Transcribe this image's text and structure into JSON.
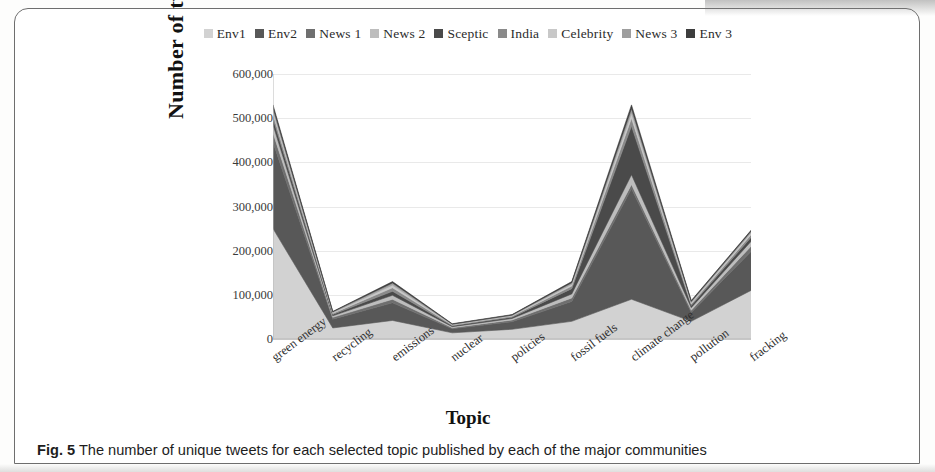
{
  "figure": {
    "caption_prefix": "Fig. 5",
    "caption_text": "The number of unique tweets for each selected topic published by each of the major communities"
  },
  "chart_data": {
    "type": "area",
    "stacked": true,
    "title": "",
    "xlabel": "Topic",
    "ylabel": "Number of tweets",
    "ylim": [
      0,
      600000
    ],
    "yticks": [
      0,
      100000,
      200000,
      300000,
      400000,
      500000,
      600000
    ],
    "ytick_labels": [
      "0",
      "100,000",
      "200,000",
      "300,000",
      "400,000",
      "500,000",
      "600,000"
    ],
    "grid": true,
    "legend_position": "top",
    "categories": [
      "green energy",
      "recycling",
      "emissions",
      "nuclear",
      "policies",
      "fossil fuels",
      "climate change",
      "pollution",
      "fracking"
    ],
    "series": [
      {
        "name": "Env1",
        "color": "#d2d2d2",
        "values": [
          250000,
          25000,
          42000,
          14000,
          22000,
          40000,
          90000,
          40000,
          110000
        ]
      },
      {
        "name": "Env2",
        "color": "#585858",
        "values": [
          195000,
          20000,
          40000,
          9000,
          17000,
          45000,
          250000,
          20000,
          88000
        ]
      },
      {
        "name": "News 1",
        "color": "#6f6f6f",
        "values": [
          22000,
          4000,
          8000,
          2500,
          4000,
          8000,
          10000,
          5000,
          12000
        ]
      },
      {
        "name": "News 2",
        "color": "#bdbdbd",
        "values": [
          18000,
          3500,
          9000,
          2500,
          3500,
          9000,
          22000,
          6000,
          11000
        ]
      },
      {
        "name": "Sceptic",
        "color": "#4a4a4a",
        "values": [
          14000,
          3000,
          9000,
          2000,
          3000,
          12000,
          110000,
          5000,
          9000
        ]
      },
      {
        "name": "India",
        "color": "#8a8a8a",
        "values": [
          10000,
          2500,
          8000,
          1500,
          2000,
          6000,
          18000,
          3500,
          6000
        ]
      },
      {
        "name": "Celebrity",
        "color": "#c8c8c8",
        "values": [
          8000,
          2000,
          6000,
          1200,
          1500,
          4000,
          12000,
          3000,
          4500
        ]
      },
      {
        "name": "News 3",
        "color": "#9e9e9e",
        "values": [
          7000,
          1500,
          5000,
          1000,
          1200,
          3500,
          10000,
          2500,
          3500
        ]
      },
      {
        "name": "Env 3",
        "color": "#3d3d3d",
        "values": [
          6000,
          1000,
          3000,
          800,
          1000,
          2500,
          8000,
          2000,
          2000
        ]
      }
    ],
    "totals": [
      530000,
      62500,
      130000,
      34500,
      55200,
      130000,
      530000,
      87000,
      246000
    ]
  }
}
